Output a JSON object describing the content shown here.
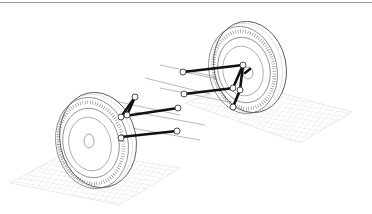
{
  "figure": {
    "title": "Multi-link suspension wireframe",
    "colors": {
      "background": "#ffffff",
      "wire": "#555555",
      "grid": "#c8c8c8",
      "link": "#111111",
      "axis_line": "#888888",
      "top_rule": "#9a9a9a"
    },
    "parts": {
      "left_wheel": "front-left tire wireframe",
      "right_wheel": "rear-right tire wireframe",
      "links": "suspension link rods",
      "joints": "ball joints",
      "ground_left": "ground grid plane (left)",
      "ground_right": "ground grid plane (right)"
    }
  }
}
